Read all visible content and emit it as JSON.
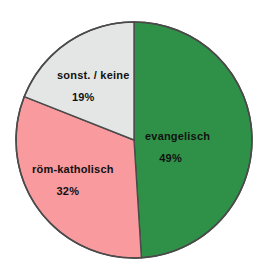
{
  "chart_data": {
    "type": "pie",
    "title": "",
    "subtitle": "",
    "xlabel": "",
    "ylabel": "",
    "legend_position": "none",
    "labels_inside_slices": true,
    "start_angle_deg": 0,
    "direction": "clockwise",
    "unit": "%",
    "categories": [
      "evangelisch",
      "röm-katholisch",
      "sonst. / keine"
    ],
    "values": [
      49,
      32,
      19
    ],
    "value_labels": [
      "49%",
      "32%",
      "19%"
    ],
    "colors": [
      "#2f9148",
      "#f89a9e",
      "#e4e6e6"
    ],
    "slices": [
      {
        "label": "evangelisch",
        "value": 49,
        "value_label": "49%",
        "color": "#2f9148",
        "start_angle_deg": 0,
        "end_angle_deg": 176.4
      },
      {
        "label": "röm-katholisch",
        "value": 32,
        "value_label": "32%",
        "color": "#f89a9e",
        "start_angle_deg": 176.4,
        "end_angle_deg": 291.6
      },
      {
        "label": "sonst. / keine",
        "value": 19,
        "value_label": "19%",
        "color": "#e4e6e6",
        "start_angle_deg": 291.6,
        "end_angle_deg": 360
      }
    ],
    "outline_color": "#4a4a4a",
    "background_color": "#ffffff"
  },
  "labels": {
    "evangelisch": {
      "name": "evangelisch",
      "value": "49%"
    },
    "roem_katholisch": {
      "name": "röm-katholisch",
      "value": "32%"
    },
    "sonst_keine": {
      "name": "sonst. / keine",
      "value": "19%"
    }
  }
}
